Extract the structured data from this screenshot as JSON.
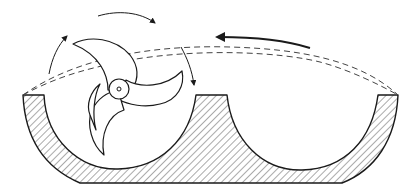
{
  "diagram": {
    "colors": {
      "line": "#1a1a1a",
      "dash": "#444444",
      "background": "#ffffff",
      "hatch": "#555555"
    },
    "elements": [
      {
        "name": "housing",
        "kind": "hatched-section"
      },
      {
        "name": "left-pocket",
        "kind": "semicircular-cavity"
      },
      {
        "name": "right-pocket",
        "kind": "semicircular-cavity"
      },
      {
        "name": "central-ridge",
        "kind": "raised-divider"
      },
      {
        "name": "impeller",
        "kind": "four-blade-rotor",
        "blades": 4
      },
      {
        "name": "hub",
        "kind": "circle"
      },
      {
        "name": "sweep-path",
        "kind": "dashed-arc",
        "count": 2
      },
      {
        "name": "rotation-arrows",
        "kind": "thin-curved-arrows",
        "count": 3,
        "direction": "clockwise"
      },
      {
        "name": "flow-arrow",
        "kind": "bold-curved-arrow",
        "direction": "leftward"
      }
    ],
    "labels": []
  }
}
